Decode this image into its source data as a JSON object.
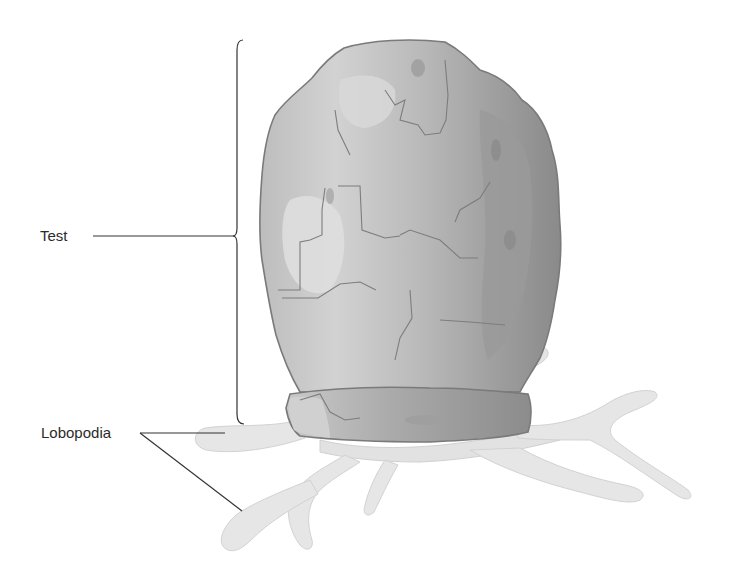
{
  "diagram": {
    "labels": {
      "test": "Test",
      "lobopodia": "Lobopodia"
    },
    "colors": {
      "background": "#ffffff",
      "label_text": "#2b2b2b",
      "leader_line": "#333333",
      "test_light": "#cfcfcf",
      "test_mid": "#b5b5b5",
      "test_dark": "#8f8f8f",
      "lobopodia_fill": "#e6e6e6",
      "lobopodia_shade": "#d3d3d3"
    }
  }
}
